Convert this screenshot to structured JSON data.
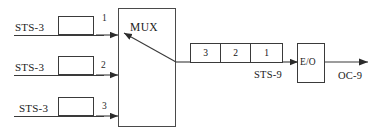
{
  "diagram": {
    "line_color": "#3a3a3a",
    "background": "#ffffff",
    "inputs": [
      {
        "label": "STS-3",
        "channel": "1"
      },
      {
        "label": "STS-3",
        "channel": "2"
      },
      {
        "label": "STS-3",
        "channel": "3"
      }
    ],
    "mux": {
      "label": "MUX"
    },
    "frame": {
      "label": "STS-9",
      "cells": [
        "3",
        "2",
        "1"
      ]
    },
    "converter": {
      "label": "E/O"
    },
    "output": {
      "label": "OC-9"
    }
  }
}
